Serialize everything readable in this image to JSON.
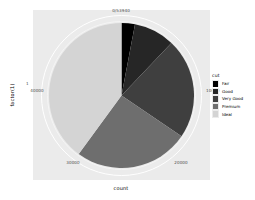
{
  "chart_data": {
    "type": "pie",
    "title": "",
    "xlabel": "count",
    "ylabel": "factor(1)",
    "categories": [
      "Fair",
      "Good",
      "Very Good",
      "Premium",
      "Ideal"
    ],
    "values": [
      1610,
      4906,
      12082,
      13791,
      21551
    ],
    "total": 53940,
    "colors": [
      "#000000",
      "#262626",
      "#3f3f3f",
      "#6e6e6e",
      "#d4d4d4"
    ],
    "legend": {
      "title": "cut",
      "position": "right",
      "entries": [
        {
          "label": "Fair",
          "color": "#000000"
        },
        {
          "label": "Good",
          "color": "#262626"
        },
        {
          "label": "Very Good",
          "color": "#3f3f3f"
        },
        {
          "label": "Premium",
          "color": "#6e6e6e"
        },
        {
          "label": "Ideal",
          "color": "#d4d4d4"
        }
      ]
    },
    "axis": {
      "theta_ticks": [
        "0/53940",
        "10000",
        "20000",
        "30000",
        "40000"
      ],
      "y_ticks": [
        "1"
      ],
      "grid": true,
      "panel_background": "#ebebeb",
      "grid_color": "#ffffff"
    },
    "ticks": {
      "top": "0/53940",
      "right": "10000",
      "bottom_right": "20000",
      "bottom_left": "30000",
      "left": "40000",
      "y": "1"
    }
  }
}
